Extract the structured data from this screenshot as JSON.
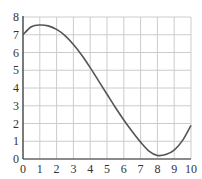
{
  "chart_data": {
    "type": "line",
    "title": "",
    "xlabel": "",
    "ylabel": "",
    "xlim": [
      0,
      10
    ],
    "ylim": [
      0,
      8
    ],
    "grid": true,
    "legend": null,
    "x_ticks": [
      0,
      1,
      2,
      3,
      4,
      5,
      6,
      7,
      8,
      9,
      10
    ],
    "y_ticks": [
      0,
      1,
      2,
      3,
      4,
      5,
      6,
      7,
      8
    ],
    "series": [
      {
        "name": "f(x)",
        "x": [
          0,
          0.5,
          1,
          1.5,
          2,
          2.5,
          3,
          3.5,
          4,
          4.5,
          5,
          5.5,
          6,
          6.5,
          7,
          7.5,
          8,
          8.5,
          9,
          9.5,
          10
        ],
        "y": [
          7.0,
          7.45,
          7.55,
          7.5,
          7.3,
          6.95,
          6.45,
          5.85,
          5.15,
          4.4,
          3.65,
          2.9,
          2.2,
          1.55,
          0.95,
          0.45,
          0.2,
          0.25,
          0.5,
          1.05,
          1.9
        ]
      }
    ]
  },
  "colors": {
    "line": "#555555",
    "grid": "#cccccc",
    "axis": "#333333",
    "background": "#ffffff"
  }
}
